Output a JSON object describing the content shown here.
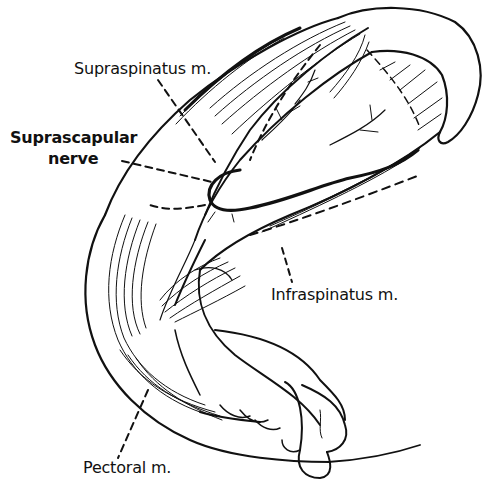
{
  "figure": {
    "type": "anatomical line drawing",
    "ink_color": "#111111",
    "background_color": "#ffffff"
  },
  "labels": {
    "supraspinatus": "Supraspinatus m.",
    "suprascapular_line1": "Suprascapular",
    "suprascapular_line2": "nerve",
    "infraspinatus": "Infraspinatus m.",
    "pectoral": "Pectoral m."
  }
}
